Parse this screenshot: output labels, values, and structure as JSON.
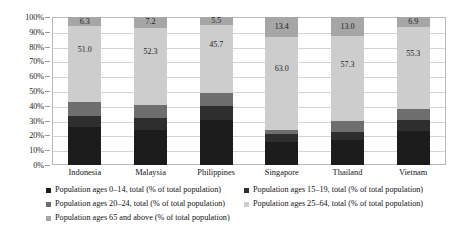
{
  "chart_data": {
    "type": "bar",
    "subtype": "100% stacked column",
    "title": "",
    "xlabel": "",
    "ylabel": "",
    "ylim": [
      0,
      100
    ],
    "ytick_labels": [
      "100%",
      "90%",
      "80%",
      "70%",
      "60%",
      "50%",
      "40%",
      "30%",
      "20%",
      "10%",
      "0%"
    ],
    "ytick_values": [
      100,
      90,
      80,
      70,
      60,
      50,
      40,
      30,
      20,
      10,
      0
    ],
    "grid": true,
    "legend_position": "bottom",
    "categories": [
      "Indonesia",
      "Malaysia",
      "Philippines",
      "Singapore",
      "Thailand",
      "Vietnam"
    ],
    "series": [
      {
        "name": "Population ages 0–14, total (% of total population)",
        "color": "#1c1c1c",
        "values": [
          25.8,
          23.6,
          30.4,
          15.6,
          16.9,
          23.3
        ],
        "labels": [
          "",
          "",
          "",
          "",
          "",
          ""
        ]
      },
      {
        "name": "Population ages 15–19, total (% of total population)",
        "color": "#2e2e2e",
        "values": [
          7.6,
          8.0,
          9.6,
          5.1,
          5.4,
          7.2
        ],
        "labels": [
          "",
          "",
          "",
          "",
          "",
          ""
        ]
      },
      {
        "name": "Population ages 20–24, total (% of total population)",
        "color": "#6e6e6e",
        "values": [
          9.3,
          8.9,
          8.8,
          2.9,
          7.4,
          7.3
        ],
        "labels": [
          "",
          "",
          "",
          "",
          "",
          ""
        ]
      },
      {
        "name": "Population ages 25–64, total (% of total population)",
        "color": "#cdcdcd",
        "values": [
          51.0,
          52.3,
          45.7,
          63.0,
          57.3,
          55.3
        ],
        "labels": [
          "51.0",
          "52.3",
          "45.7",
          "63.0",
          "57.3",
          "55.3"
        ]
      },
      {
        "name": "Population ages 65 and above (% of total population)",
        "color": "#a6a6a6",
        "values": [
          6.3,
          7.2,
          5.5,
          13.4,
          13.0,
          6.9
        ],
        "labels": [
          "6.3",
          "7.2",
          "5.5",
          "13.4",
          "13.0",
          "6.9"
        ]
      }
    ]
  },
  "legend": {
    "items": [
      {
        "label": "Population ages 0–14, total (% of total population)",
        "color": "#1c1c1c"
      },
      {
        "label": "Population ages 15–19, total (% of total population)",
        "color": "#2e2e2e"
      },
      {
        "label": "Population ages 20–24, total (% of total population)",
        "color": "#6e6e6e"
      },
      {
        "label": "Population ages 25–64, total (% of total population)",
        "color": "#cdcdcd"
      },
      {
        "label": "Population ages 65 and above (% of total population)",
        "color": "#a6a6a6"
      }
    ]
  }
}
